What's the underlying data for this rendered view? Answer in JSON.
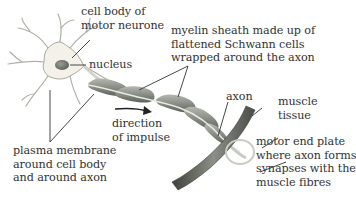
{
  "diagram": {
    "labels": {
      "cell_body": [
        "cell body of",
        "motor neurone"
      ],
      "nucleus": [
        "nucleus"
      ],
      "myelin_sheath": [
        "myelin sheath made up of",
        "flattened Schwann cells",
        "wrapped around the axon"
      ],
      "direction": [
        "direction",
        "of impulse"
      ],
      "plasma_membrane": [
        "plasma membrane",
        "around cell body",
        "and around axon"
      ],
      "axon": [
        "axon"
      ],
      "muscle_tissue": [
        "muscle",
        "tissue"
      ],
      "motor_end_plate": [
        "motor end plate",
        "where axon forms",
        "synapses with the",
        "muscle fibres"
      ]
    },
    "colors": {
      "cell_body_fill": "#f4f2e8",
      "cell_outline": "#a8a8a0",
      "nucleus": "#6f7368",
      "myelin": "#8d918a",
      "myelin_highlight": "#c9ccc5",
      "axon_core": "#e8eae2",
      "muscle": "#5f635c",
      "text": "#333333",
      "leader_line": "#333333"
    }
  }
}
